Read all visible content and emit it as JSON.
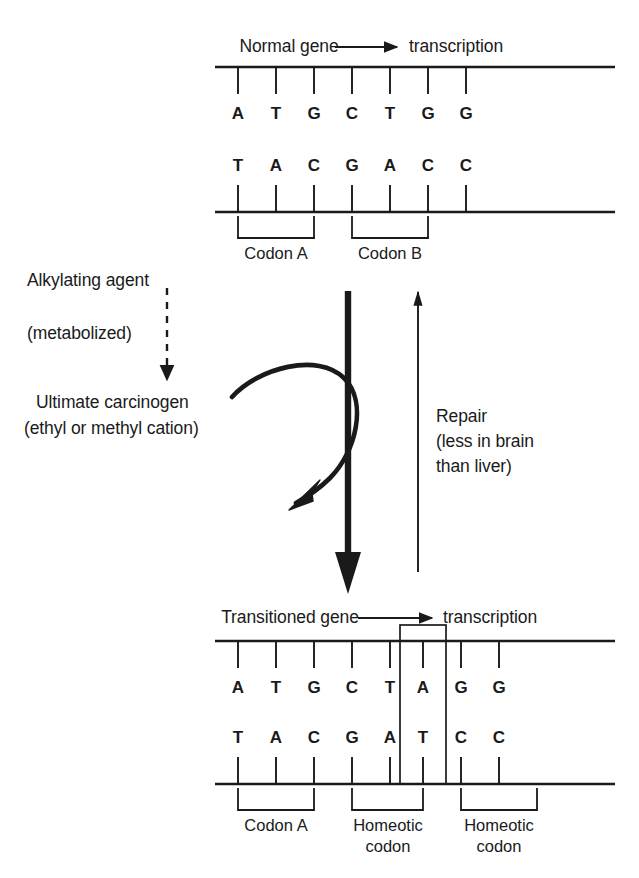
{
  "figure": {
    "ink_color": "#1a1a1a",
    "background_color": "#ffffff"
  },
  "top_panel": {
    "gene_label": "Normal gene",
    "transcription_label": "transcription",
    "arrow_icon": "arrow-right",
    "coding_strand": {
      "bases": [
        "A",
        "T",
        "G",
        "C",
        "T",
        "G",
        "G"
      ]
    },
    "template_strand": {
      "bases": [
        "T",
        "A",
        "C",
        "G",
        "A",
        "C",
        "C"
      ]
    },
    "codon_brackets": [
      {
        "label": "Codon A"
      },
      {
        "label": "Codon B"
      }
    ]
  },
  "pathway": {
    "alkylating_agent_label": "Alkylating agent",
    "metabolized_label": "(metabolized)",
    "ultimate_carcinogen_label": "Ultimate carcinogen",
    "carcinogen_detail_label": "(ethyl or methyl cation)",
    "dashed_arrow_icon": "dashed-arrow-down",
    "curved_arrow_icon": "curved-arrow-down",
    "thick_arrow_icon": "thick-arrow-down"
  },
  "repair": {
    "line1": "Repair",
    "line2": "(less in brain",
    "line3": "than liver)",
    "arrow_icon": "arrow-up"
  },
  "bottom_panel": {
    "gene_label": "Transitioned gene",
    "transcription_label": "transcription",
    "arrow_icon": "arrow-right",
    "coding_strand": {
      "bases": [
        "A",
        "T",
        "G",
        "C",
        "T",
        "A",
        "G",
        "G"
      ]
    },
    "template_strand": {
      "bases": [
        "T",
        "A",
        "C",
        "G",
        "A",
        "T",
        "C",
        "C"
      ]
    },
    "mutation_highlight": {
      "coding_base": "A",
      "template_base": "T"
    },
    "codon_brackets": [
      {
        "label": "Codon A"
      },
      {
        "label": "Homeotic\ncodon"
      },
      {
        "label": "Homeotic\ncodon"
      }
    ]
  }
}
